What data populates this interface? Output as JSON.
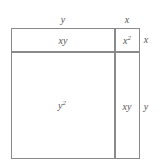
{
  "diagram": {
    "title": "",
    "outer_labels": {
      "top_left": "y",
      "top_right": "x",
      "right_top": "x",
      "right_bottom": "y"
    },
    "regions": [
      {
        "id": "top-left",
        "label_base": "xy",
        "label_sup": ""
      },
      {
        "id": "top-right",
        "label_base": "x",
        "label_sup": "2"
      },
      {
        "id": "bottom-left",
        "label_base": "y",
        "label_sup": "2"
      },
      {
        "id": "bottom-right",
        "label_base": "xy",
        "label_sup": ""
      }
    ],
    "line_color": "#8a8a8a"
  }
}
